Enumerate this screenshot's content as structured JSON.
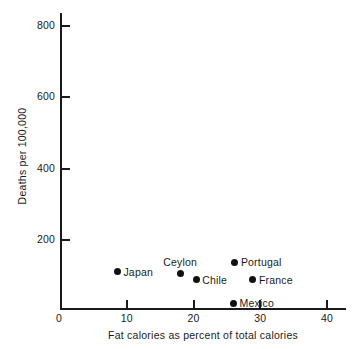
{
  "chart_data": {
    "type": "scatter",
    "title": "",
    "xlabel": "Fat calories as percent of total calories",
    "ylabel": "Deaths per 100,000",
    "xlim": [
      0,
      42
    ],
    "ylim": [
      0,
      840
    ],
    "xticks": [
      0,
      10,
      20,
      30,
      40
    ],
    "xtick_labels": [
      "0",
      "10",
      "20",
      "30",
      "40"
    ],
    "yticks": [
      200,
      400,
      600,
      800
    ],
    "ytick_labels": [
      "200",
      "400",
      "600",
      "800"
    ],
    "grid": false,
    "legend": "none",
    "points": [
      {
        "label": "Japan",
        "x": 8.6,
        "y": 110,
        "label_pos": "right"
      },
      {
        "label": "Ceylon",
        "x": 18.0,
        "y": 105,
        "label_pos": "above"
      },
      {
        "label": "Chile",
        "x": 20.4,
        "y": 88,
        "label_pos": "right"
      },
      {
        "label": "Portugal",
        "x": 26.2,
        "y": 137,
        "label_pos": "right"
      },
      {
        "label": "France",
        "x": 28.9,
        "y": 88,
        "label_pos": "right"
      },
      {
        "label": "Mexico",
        "x": 26.0,
        "y": 22,
        "label_pos": "right"
      }
    ]
  },
  "colors": {
    "ink": "#1a1a1a",
    "marker": "#111111",
    "background": "#ffffff"
  }
}
